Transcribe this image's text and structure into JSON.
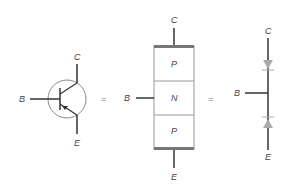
{
  "symbol": {
    "collector_label": "C",
    "base_label": "B",
    "emitter_label": "E"
  },
  "equals_1": "=",
  "layers": {
    "collector_label": "C",
    "base_label": "B",
    "emitter_label": "E",
    "regions": [
      "P",
      "N",
      "P"
    ]
  },
  "equals_2": "=",
  "diode_model": {
    "collector_label": "C",
    "base_label": "B",
    "emitter_label": "E"
  },
  "colors": {
    "line": "#333333",
    "circle": "#888888",
    "box": "#999999",
    "diode": "#aaaaaa"
  }
}
